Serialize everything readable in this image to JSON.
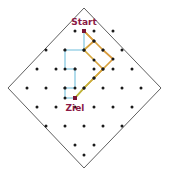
{
  "figure": {
    "title": "",
    "background_color": "#ffffff",
    "width": 169,
    "height": 175
  },
  "boundary": {
    "name": "diamond-boundary",
    "shape": "diamond",
    "stroke_color": "#4d4d4d",
    "stroke_width": 0.9,
    "fill": "none",
    "vertices": [
      {
        "x": 84,
        "y": 8
      },
      {
        "x": 161,
        "y": 88
      },
      {
        "x": 84,
        "y": 168
      },
      {
        "x": 8,
        "y": 88
      }
    ]
  },
  "lattice": {
    "name": "dot-lattice",
    "dot_color": "#1a1a1a",
    "dot_radius": 1.5,
    "points": [
      {
        "x": 46,
        "y": 88
      },
      {
        "x": 65,
        "y": 88
      },
      {
        "x": 103,
        "y": 88
      },
      {
        "x": 122,
        "y": 88
      },
      {
        "x": 141,
        "y": 88
      },
      {
        "x": 27,
        "y": 88
      },
      {
        "x": 56,
        "y": 69
      },
      {
        "x": 75,
        "y": 69
      },
      {
        "x": 94,
        "y": 69
      },
      {
        "x": 113,
        "y": 69
      },
      {
        "x": 132,
        "y": 69
      },
      {
        "x": 37,
        "y": 69
      },
      {
        "x": 65,
        "y": 50
      },
      {
        "x": 84,
        "y": 50
      },
      {
        "x": 103,
        "y": 50
      },
      {
        "x": 122,
        "y": 50
      },
      {
        "x": 46,
        "y": 50
      },
      {
        "x": 75,
        "y": 31
      },
      {
        "x": 94,
        "y": 31
      },
      {
        "x": 113,
        "y": 31
      },
      {
        "x": 56,
        "y": 107
      },
      {
        "x": 75,
        "y": 107
      },
      {
        "x": 94,
        "y": 107
      },
      {
        "x": 113,
        "y": 107
      },
      {
        "x": 132,
        "y": 107
      },
      {
        "x": 37,
        "y": 107
      },
      {
        "x": 65,
        "y": 126
      },
      {
        "x": 84,
        "y": 126
      },
      {
        "x": 103,
        "y": 126
      },
      {
        "x": 122,
        "y": 126
      },
      {
        "x": 46,
        "y": 126
      },
      {
        "x": 75,
        "y": 145
      },
      {
        "x": 94,
        "y": 145
      },
      {
        "x": 84,
        "y": 155
      }
    ]
  },
  "paths": [
    {
      "name": "path-left-blue",
      "color": "#9fd4e8",
      "stroke_width": 1.6,
      "vertices": [
        {
          "x": 84,
          "y": 31
        },
        {
          "x": 84,
          "y": 50
        },
        {
          "x": 65,
          "y": 50
        },
        {
          "x": 65,
          "y": 69
        },
        {
          "x": 75,
          "y": 69
        },
        {
          "x": 75,
          "y": 88
        },
        {
          "x": 65,
          "y": 88
        },
        {
          "x": 65,
          "y": 98
        },
        {
          "x": 75,
          "y": 98
        }
      ],
      "node_color": "#1a1a1a",
      "node_radius": 1.5
    },
    {
      "name": "path-right-olive-orange",
      "color_start": "#b8b83a",
      "color_mid": "#d4a93c",
      "color_end": "#e08a3c",
      "stroke_width": 1.7,
      "vertices": [
        {
          "x": 84,
          "y": 31
        },
        {
          "x": 94,
          "y": 41
        },
        {
          "x": 103,
          "y": 50
        },
        {
          "x": 113,
          "y": 59
        },
        {
          "x": 103,
          "y": 69
        },
        {
          "x": 94,
          "y": 78
        },
        {
          "x": 84,
          "y": 88
        },
        {
          "x": 75,
          "y": 98
        }
      ],
      "inner_vertices": [
        {
          "x": 84,
          "y": 31
        },
        {
          "x": 94,
          "y": 41
        },
        {
          "x": 84,
          "y": 50
        },
        {
          "x": 94,
          "y": 60
        },
        {
          "x": 103,
          "y": 69
        },
        {
          "x": 94,
          "y": 78
        },
        {
          "x": 84,
          "y": 88
        },
        {
          "x": 75,
          "y": 98
        }
      ],
      "node_color": "#1a1a1a",
      "node_radius": 1.5
    }
  ],
  "markers": [
    {
      "name": "start-marker",
      "label": "Start",
      "x": 84,
      "y": 31,
      "label_x": 84,
      "label_y": 22,
      "marker_color": "#7a1535",
      "label_color": "#8b1a45",
      "size": 4
    },
    {
      "name": "ziel-marker",
      "label": "Ziel",
      "x": 75,
      "y": 98,
      "label_x": 75,
      "label_y": 108,
      "marker_color": "#7a1535",
      "label_color": "#8b1a45",
      "size": 4
    }
  ]
}
